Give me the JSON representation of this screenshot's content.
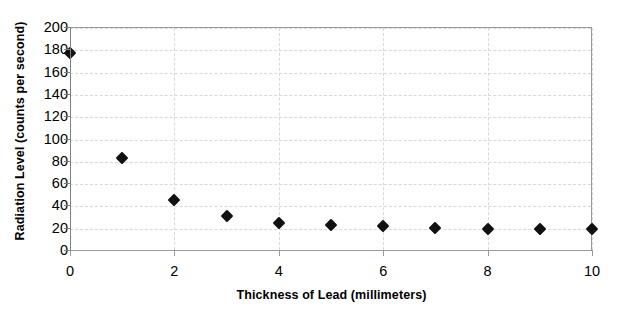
{
  "chart_data": {
    "type": "scatter",
    "title": "",
    "xlabel": "Thickness of Lead (millimeters)",
    "ylabel": "Radiation Level (counts per second)",
    "xlim": [
      0,
      10
    ],
    "ylim": [
      0,
      200
    ],
    "xticks": [
      0,
      1,
      2,
      3,
      4,
      5,
      6,
      7,
      8,
      9,
      10
    ],
    "xtick_labels": [
      "0",
      "",
      "2",
      "",
      "4",
      "",
      "6",
      "",
      "8",
      "",
      "10"
    ],
    "xtick_labels_shown": [
      "0",
      "2",
      "4",
      "6",
      "8",
      "10"
    ],
    "yticks": [
      0,
      20,
      40,
      60,
      80,
      100,
      120,
      140,
      160,
      180,
      200
    ],
    "ytick_labels": [
      "0",
      "20",
      "40",
      "60",
      "80",
      "100",
      "120",
      "140",
      "160",
      "180",
      "200"
    ],
    "grid": true,
    "grid_style": "dashed",
    "grid_color": "#d8d8d8",
    "legend": false,
    "marker": "diamond",
    "marker_color": "#111111",
    "x": [
      0,
      1,
      2,
      3,
      4,
      5,
      6,
      7,
      8,
      9,
      10
    ],
    "values": [
      178,
      83,
      46,
      31,
      25,
      23,
      22,
      21,
      20,
      20,
      20
    ],
    "series": [
      {
        "name": "Radiation Level",
        "points": [
          {
            "x": 0,
            "y": 178
          },
          {
            "x": 1,
            "y": 83
          },
          {
            "x": 2,
            "y": 46
          },
          {
            "x": 3,
            "y": 31
          },
          {
            "x": 4,
            "y": 25
          },
          {
            "x": 5,
            "y": 23
          },
          {
            "x": 6,
            "y": 22
          },
          {
            "x": 7,
            "y": 21
          },
          {
            "x": 8,
            "y": 20
          },
          {
            "x": 9,
            "y": 20
          },
          {
            "x": 10,
            "y": 20
          }
        ]
      }
    ]
  },
  "axes": {
    "frame_color": "#9a9a9a"
  }
}
